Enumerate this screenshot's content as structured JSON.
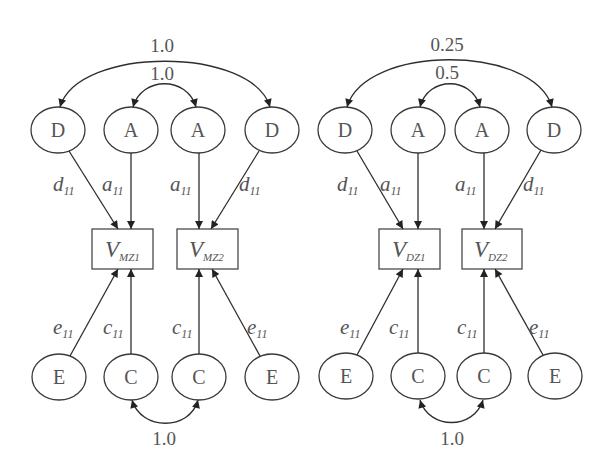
{
  "colors": {
    "background": "#ffffff",
    "stroke": "#2e2e2e",
    "text": "#555555"
  },
  "panels": [
    {
      "twin_type": "MZ",
      "top_arcs": {
        "outer_label": "1.0",
        "inner_label": "1.0"
      },
      "bottom_arc_label": "1.0",
      "top_nodes": [
        "D",
        "A",
        "A",
        "D"
      ],
      "bottom_nodes": [
        "E",
        "C",
        "C",
        "E"
      ],
      "boxes": [
        {
          "main": "V",
          "sub": "MZ1"
        },
        {
          "main": "V",
          "sub": "MZ2"
        }
      ],
      "top_paths": [
        {
          "main": "d",
          "sub": "11"
        },
        {
          "main": "a",
          "sub": "11"
        },
        {
          "main": "a",
          "sub": "11"
        },
        {
          "main": "d",
          "sub": "11"
        }
      ],
      "bottom_paths": [
        {
          "main": "e",
          "sub": "11"
        },
        {
          "main": "c",
          "sub": "11"
        },
        {
          "main": "c",
          "sub": "11"
        },
        {
          "main": "e",
          "sub": "11"
        }
      ]
    },
    {
      "twin_type": "DZ",
      "top_arcs": {
        "outer_label": "0.25",
        "inner_label": "0.5"
      },
      "bottom_arc_label": "1.0",
      "top_nodes": [
        "D",
        "A",
        "A",
        "D"
      ],
      "bottom_nodes": [
        "E",
        "C",
        "C",
        "E"
      ],
      "boxes": [
        {
          "main": "V",
          "sub": "DZ1"
        },
        {
          "main": "V",
          "sub": "DZ2"
        }
      ],
      "top_paths": [
        {
          "main": "d",
          "sub": "11"
        },
        {
          "main": "a",
          "sub": "11"
        },
        {
          "main": "a",
          "sub": "11"
        },
        {
          "main": "d",
          "sub": "11"
        }
      ],
      "bottom_paths": [
        {
          "main": "e",
          "sub": "11"
        },
        {
          "main": "c",
          "sub": "11"
        },
        {
          "main": "c",
          "sub": "11"
        },
        {
          "main": "e",
          "sub": "11"
        }
      ]
    }
  ]
}
